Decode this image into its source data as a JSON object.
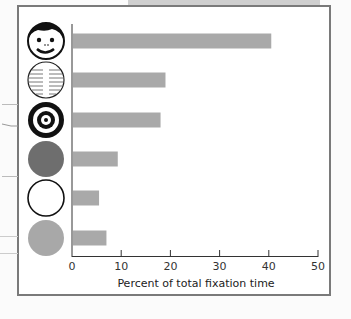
{
  "chart_data": {
    "type": "bar",
    "orientation": "horizontal",
    "title": "",
    "xlabel": "Percent of total fixation time",
    "ylabel": "",
    "xlim": [
      0,
      50
    ],
    "xticks": [
      0,
      10,
      20,
      30,
      40,
      50
    ],
    "grid": false,
    "legend": null,
    "categories": [
      "face",
      "newsprint",
      "bull's-eye",
      "dark disc",
      "white disc",
      "gray disc"
    ],
    "values": [
      40.5,
      19,
      18,
      9.3,
      5.5,
      7
    ],
    "bar_color": "#a9a9a9"
  },
  "axis": {
    "title": "Percent of total fixation time",
    "tick_labels": [
      "0",
      "10",
      "20",
      "30",
      "40",
      "50"
    ]
  },
  "icons": [
    "face-icon",
    "newsprint-icon",
    "bullseye-icon",
    "dark-disc-icon",
    "white-disc-icon",
    "gray-disc-icon"
  ],
  "colors": {
    "bar": "#a9a9a9",
    "dark_disc": "#6e6e6e",
    "gray_disc": "#a8a8a8",
    "frame": "#7a7a7a"
  }
}
